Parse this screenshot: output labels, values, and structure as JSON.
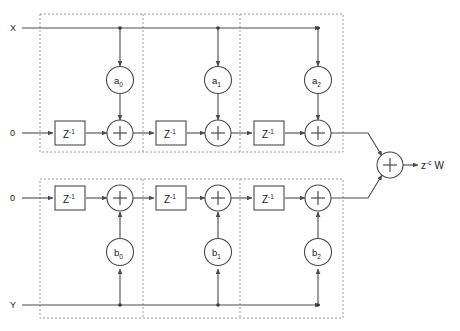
{
  "diagram": {
    "colors": {
      "wire": "#4a4a4a",
      "dashed_box": "#9a9a9a",
      "text": "#1a1a1a",
      "background": "#ffffff"
    },
    "inputs": [
      {
        "id": "x-input",
        "label": "X",
        "x": 10,
        "y": 31
      },
      {
        "id": "zero-input-top",
        "label": "0",
        "x": 10,
        "y": 136
      },
      {
        "id": "zero-input-bottom",
        "label": "0",
        "x": 10,
        "y": 201
      },
      {
        "id": "y-input",
        "label": "Y",
        "x": 10,
        "y": 308
      }
    ],
    "output": {
      "id": "output-label",
      "base": "z",
      "exponent": "-c",
      "signal": "W",
      "text": "z-c W"
    },
    "delay_blocks": [
      {
        "id": "delay-top-0",
        "base": "Z",
        "exponent": "-1",
        "cx": 70,
        "cy": 133
      },
      {
        "id": "delay-top-1",
        "base": "Z",
        "exponent": "-1",
        "cx": 171,
        "cy": 133
      },
      {
        "id": "delay-top-2",
        "base": "Z",
        "exponent": "-1",
        "cx": 269,
        "cy": 133
      },
      {
        "id": "delay-bottom-0",
        "base": "Z",
        "exponent": "-1",
        "cx": 70,
        "cy": 198
      },
      {
        "id": "delay-bottom-1",
        "base": "Z",
        "exponent": "-1",
        "cx": 171,
        "cy": 198
      },
      {
        "id": "delay-bottom-2",
        "base": "Z",
        "exponent": "-1",
        "cx": 269,
        "cy": 198
      }
    ],
    "coefficients": [
      {
        "id": "coef-a0",
        "base": "a",
        "sub": "0",
        "cx": 120,
        "cy": 80
      },
      {
        "id": "coef-a1",
        "base": "a",
        "sub": "1",
        "cx": 218,
        "cy": 80
      },
      {
        "id": "coef-a2",
        "base": "a",
        "sub": "2",
        "cx": 318,
        "cy": 80
      },
      {
        "id": "coef-b0",
        "base": "b",
        "sub": "0",
        "cx": 120,
        "cy": 252
      },
      {
        "id": "coef-b1",
        "base": "b",
        "sub": "1",
        "cx": 218,
        "cy": 252
      },
      {
        "id": "coef-b2",
        "base": "b",
        "sub": "2",
        "cx": 318,
        "cy": 252
      }
    ],
    "adders": [
      {
        "id": "adder-top-0",
        "symbol": "+",
        "cx": 120,
        "cy": 133
      },
      {
        "id": "adder-top-1",
        "symbol": "+",
        "cx": 218,
        "cy": 133
      },
      {
        "id": "adder-top-2",
        "symbol": "+",
        "cx": 318,
        "cy": 133
      },
      {
        "id": "adder-bottom-0",
        "symbol": "+",
        "cx": 120,
        "cy": 198
      },
      {
        "id": "adder-bottom-1",
        "symbol": "+",
        "cx": 218,
        "cy": 198
      },
      {
        "id": "adder-bottom-2",
        "symbol": "+",
        "cx": 318,
        "cy": 198
      },
      {
        "id": "adder-output",
        "symbol": "+",
        "cx": 390,
        "cy": 165
      }
    ],
    "stage_boxes": [
      {
        "id": "stage-box-top",
        "x": 40,
        "y": 14,
        "w": 303,
        "h": 138
      },
      {
        "id": "stage-box-bottom",
        "x": 40,
        "y": 179,
        "w": 303,
        "h": 139
      }
    ],
    "stage_dividers": [
      {
        "id": "divider-top-1",
        "x": 143,
        "y1": 14,
        "y2": 152
      },
      {
        "id": "divider-top-2",
        "x": 240,
        "y1": 14,
        "y2": 152
      },
      {
        "id": "divider-bottom-1",
        "x": 143,
        "y1": 179,
        "y2": 318
      },
      {
        "id": "divider-bottom-2",
        "x": 240,
        "y1": 179,
        "y2": 318
      }
    ]
  }
}
